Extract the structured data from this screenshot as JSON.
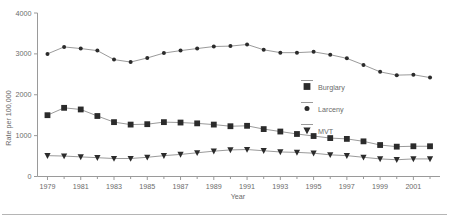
{
  "chart_data": {
    "type": "line",
    "title": "",
    "xlabel": "Year",
    "ylabel": "Rate per 100,000",
    "x": [
      1979,
      1980,
      1981,
      1982,
      1983,
      1984,
      1985,
      1986,
      1987,
      1988,
      1989,
      1990,
      1991,
      1992,
      1993,
      1994,
      1995,
      1996,
      1997,
      1998,
      1999,
      2000,
      2001,
      2002
    ],
    "xlim": [
      1978.4,
      2002.6
    ],
    "ylim": [
      0,
      4000
    ],
    "yticks": [
      0,
      1000,
      2000,
      3000,
      4000
    ],
    "ytick_labels": [
      "0",
      "1000",
      "2000",
      "3000",
      "4000"
    ],
    "xticks": [
      1979,
      1981,
      1983,
      1985,
      1987,
      1989,
      1991,
      1993,
      1995,
      1997,
      1999,
      2001
    ],
    "xtick_labels": [
      "1979",
      "1981",
      "1983",
      "1985",
      "1987",
      "1989",
      "1991",
      "1993",
      "1995",
      "1997",
      "1999",
      "2001"
    ],
    "grid": false,
    "legend_position": "upper-right-inside",
    "series": [
      {
        "name": "Burglary",
        "marker": "square",
        "color": "#2b2b2b",
        "values": [
          1500,
          1680,
          1640,
          1480,
          1330,
          1270,
          1280,
          1330,
          1320,
          1300,
          1270,
          1230,
          1240,
          1160,
          1100,
          1040,
          990,
          940,
          920,
          860,
          770,
          730,
          740,
          740
        ]
      },
      {
        "name": "Larceny",
        "marker": "circle",
        "color": "#2b2b2b",
        "values": [
          3000,
          3170,
          3130,
          3080,
          2860,
          2800,
          2900,
          3020,
          3080,
          3130,
          3180,
          3190,
          3230,
          3100,
          3030,
          3030,
          3050,
          2980,
          2890,
          2730,
          2560,
          2480,
          2490,
          2420
        ]
      },
      {
        "name": "MVT",
        "marker": "triangle-down",
        "color": "#2b2b2b",
        "values": [
          510,
          500,
          480,
          460,
          440,
          440,
          470,
          510,
          540,
          580,
          620,
          650,
          660,
          630,
          600,
          590,
          570,
          530,
          510,
          470,
          430,
          410,
          430,
          430
        ]
      }
    ]
  },
  "legend": {
    "items": [
      {
        "label": "Burglary",
        "marker": "square"
      },
      {
        "label": "Larceny",
        "marker": "circle"
      },
      {
        "label": "MVT",
        "marker": "triangle-down"
      }
    ]
  },
  "axes": {
    "y_title": "Rate per 100,000",
    "x_title": "Year"
  }
}
